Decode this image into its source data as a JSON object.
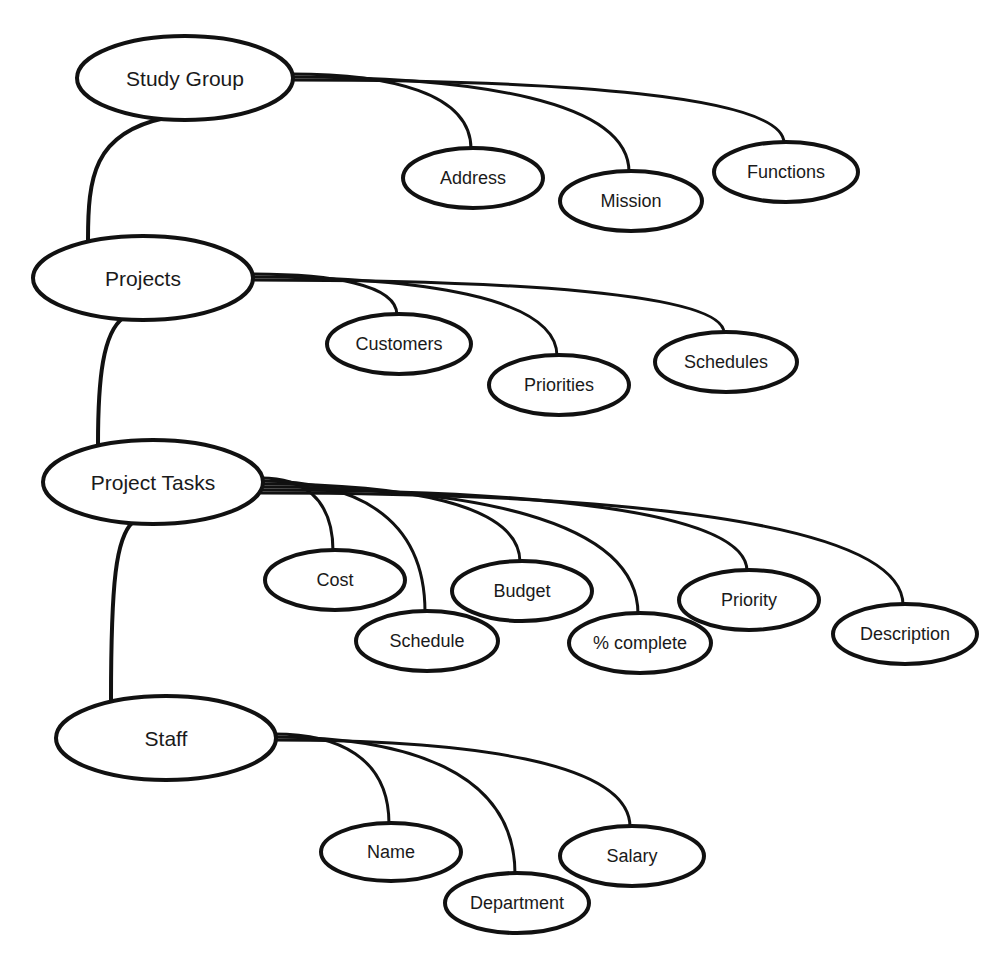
{
  "diagram": {
    "type": "hierarchical-data-model",
    "colors": {
      "stroke": "#111111",
      "background": "#ffffff",
      "text": "#1a1a1a"
    },
    "entities": [
      {
        "id": "study_group",
        "label": "Study Group",
        "ellipse": {
          "cx": 185,
          "cy": 78,
          "rx": 108,
          "ry": 42
        },
        "attributes": [
          {
            "id": "address",
            "label": "Address",
            "ellipse": {
              "cx": 473,
              "cy": 178,
              "rx": 70,
              "ry": 30
            }
          },
          {
            "id": "mission",
            "label": "Mission",
            "ellipse": {
              "cx": 631,
              "cy": 201,
              "rx": 71,
              "ry": 30
            }
          },
          {
            "id": "functions",
            "label": "Functions",
            "ellipse": {
              "cx": 786,
              "cy": 172,
              "rx": 72,
              "ry": 30
            }
          }
        ]
      },
      {
        "id": "projects",
        "label": "Projects",
        "ellipse": {
          "cx": 143,
          "cy": 278,
          "rx": 110,
          "ry": 42
        },
        "attributes": [
          {
            "id": "customers",
            "label": "Customers",
            "ellipse": {
              "cx": 399,
              "cy": 344,
              "rx": 72,
              "ry": 30
            }
          },
          {
            "id": "priorities",
            "label": "Priorities",
            "ellipse": {
              "cx": 559,
              "cy": 385,
              "rx": 70,
              "ry": 30
            }
          },
          {
            "id": "schedules",
            "label": "Schedules",
            "ellipse": {
              "cx": 726,
              "cy": 362,
              "rx": 71,
              "ry": 30
            }
          }
        ]
      },
      {
        "id": "project_tasks",
        "label": "Project Tasks",
        "ellipse": {
          "cx": 153,
          "cy": 482,
          "rx": 110,
          "ry": 42
        },
        "attributes": [
          {
            "id": "cost",
            "label": "Cost",
            "ellipse": {
              "cx": 335,
              "cy": 580,
              "rx": 70,
              "ry": 30
            }
          },
          {
            "id": "schedule",
            "label": "Schedule",
            "ellipse": {
              "cx": 427,
              "cy": 641,
              "rx": 71,
              "ry": 30
            }
          },
          {
            "id": "budget",
            "label": "Budget",
            "ellipse": {
              "cx": 522,
              "cy": 591,
              "rx": 70,
              "ry": 30
            }
          },
          {
            "id": "pct_complete",
            "label": "% complete",
            "ellipse": {
              "cx": 640,
              "cy": 643,
              "rx": 71,
              "ry": 30
            }
          },
          {
            "id": "priority",
            "label": "Priority",
            "ellipse": {
              "cx": 749,
              "cy": 600,
              "rx": 70,
              "ry": 30
            }
          },
          {
            "id": "description",
            "label": "Description",
            "ellipse": {
              "cx": 905,
              "cy": 634,
              "rx": 72,
              "ry": 30
            }
          }
        ]
      },
      {
        "id": "staff",
        "label": "Staff",
        "ellipse": {
          "cx": 166,
          "cy": 738,
          "rx": 110,
          "ry": 42
        },
        "attributes": [
          {
            "id": "name",
            "label": "Name",
            "ellipse": {
              "cx": 391,
              "cy": 852,
              "rx": 70,
              "ry": 29
            }
          },
          {
            "id": "department",
            "label": "Department",
            "ellipse": {
              "cx": 517,
              "cy": 903,
              "rx": 72,
              "ry": 30
            }
          },
          {
            "id": "salary",
            "label": "Salary",
            "ellipse": {
              "cx": 632,
              "cy": 856,
              "rx": 72,
              "ry": 30
            }
          }
        ]
      }
    ],
    "hierarchy_links": [
      {
        "from": "study_group",
        "to": "projects"
      },
      {
        "from": "projects",
        "to": "project_tasks"
      },
      {
        "from": "project_tasks",
        "to": "staff"
      }
    ]
  }
}
